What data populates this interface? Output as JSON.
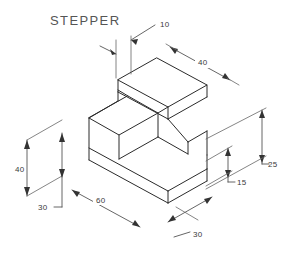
{
  "drawing": {
    "title": "STEPPER",
    "type": "isometric-technical-drawing",
    "units_implied": "mm",
    "background_color": "#ffffff",
    "line_color": "#2b2b2b",
    "dimension_color": "#555555",
    "text_color": "#3a3a3a",
    "dimensions": [
      {
        "id": "dim-10",
        "value": "10",
        "orientation": "vertical-leader",
        "label_x": 160,
        "label_y": 27,
        "describes": "top step thickness"
      },
      {
        "id": "dim-40-top",
        "value": "40",
        "orientation": "isometric-right",
        "label_x": 203,
        "label_y": 64,
        "describes": "upper step depth along top right"
      },
      {
        "id": "dim-40-left",
        "value": "40",
        "orientation": "vertical",
        "label_x": 18,
        "label_y": 172,
        "describes": "overall height at left"
      },
      {
        "id": "dim-30-left",
        "value": "30",
        "orientation": "vertical",
        "label_x": 40,
        "label_y": 210,
        "describes": "lower block height"
      },
      {
        "id": "dim-60",
        "value": "60",
        "orientation": "isometric-right-down",
        "label_x": 100,
        "label_y": 202,
        "describes": "overall length along front-left"
      },
      {
        "id": "dim-30-bottom",
        "value": "30",
        "orientation": "isometric-leader",
        "label_x": 196,
        "label_y": 236,
        "describes": "width along front-right"
      },
      {
        "id": "dim-15",
        "value": "15",
        "orientation": "vertical",
        "label_x": 238,
        "label_y": 181,
        "describes": "lower right step height"
      },
      {
        "id": "dim-25",
        "value": "25",
        "orientation": "vertical",
        "label_x": 268,
        "label_y": 160,
        "describes": "upper right height"
      }
    ]
  }
}
